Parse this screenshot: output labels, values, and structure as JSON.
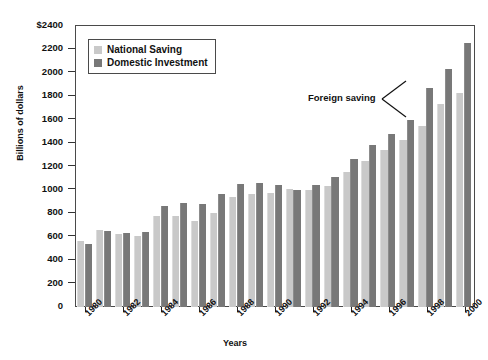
{
  "chart_data": {
    "type": "bar",
    "title": "",
    "xlabel": "Years",
    "ylabel": "Billions of dollars",
    "ylim": [
      0,
      2400
    ],
    "ytick_values": [
      0,
      200,
      400,
      600,
      800,
      1000,
      1200,
      1400,
      1600,
      1800,
      2000,
      2200,
      2400
    ],
    "ytick_labels": [
      "0",
      "200",
      "400",
      "600",
      "800",
      "1000",
      "1200",
      "1400",
      "1600",
      "1800",
      "2000",
      "2200",
      "$2400"
    ],
    "grid": false,
    "legend_position": "top-left-inside",
    "categories": [
      1980,
      1981,
      1982,
      1983,
      1984,
      1985,
      1986,
      1987,
      1988,
      1989,
      1990,
      1991,
      1992,
      1993,
      1994,
      1995,
      1996,
      1997,
      1998,
      1999,
      2000
    ],
    "xtick_labels": [
      "1980",
      "",
      "1982",
      "",
      "1984",
      "",
      "1986",
      "",
      "1988",
      "",
      "1990",
      "",
      "1992",
      "",
      "1994",
      "",
      "1996",
      "",
      "1998",
      "",
      "2000"
    ],
    "series": [
      {
        "name": "National Saving",
        "color": "#c9c9c9",
        "values": [
          560,
          655,
          625,
          605,
          775,
          775,
          735,
          805,
          940,
          965,
          975,
          1005,
          1000,
          1030,
          1150,
          1250,
          1345,
          1430,
          1545,
          1735,
          1830
        ]
      },
      {
        "name": "Domestic Investment",
        "color": "#787878",
        "values": [
          540,
          650,
          630,
          640,
          860,
          885,
          880,
          965,
          1050,
          1055,
          1045,
          1000,
          1045,
          1110,
          1265,
          1380,
          1480,
          1600,
          1870,
          2035,
          2255
        ]
      }
    ],
    "annotations": [
      {
        "text": "Foreign saving",
        "points_to": "gap between National Saving and Domestic Investment bars"
      }
    ]
  },
  "legend": {
    "items": [
      {
        "label": "National Saving",
        "swatch": "light-gray-swatch"
      },
      {
        "label": "Domestic Investment",
        "swatch": "dark-gray-swatch"
      }
    ]
  },
  "axes": {
    "y_title": "Billions of dollars",
    "x_title": "Years"
  },
  "annotation": {
    "label": "Foreign saving"
  }
}
